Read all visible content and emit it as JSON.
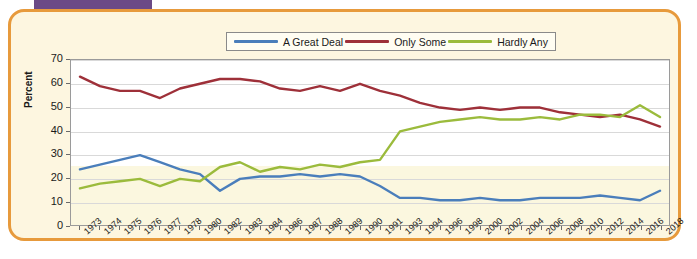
{
  "frame": {
    "accent_border_color": "#e79a3c",
    "card_background": "#fdf6e0",
    "topbar_color": "#6b4a86"
  },
  "chart_data": {
    "type": "line",
    "title": "",
    "subtitle": "",
    "xlabel": "",
    "ylabel": "Percent",
    "ylim": [
      0,
      70
    ],
    "ytick_values": [
      0,
      10,
      20,
      30,
      40,
      50,
      60,
      70
    ],
    "grid": true,
    "legend_position": "top-center",
    "categories": [
      "1973",
      "1974",
      "1975",
      "1976",
      "1977",
      "1978",
      "1980",
      "1982",
      "1983",
      "1984",
      "1986",
      "1987",
      "1988",
      "1989",
      "1990",
      "1991",
      "1993",
      "1994",
      "1996",
      "1998",
      "2000",
      "2002",
      "2004",
      "2006",
      "2008",
      "2010",
      "2012",
      "2014",
      "2016",
      "2018"
    ],
    "series": [
      {
        "name": "A Great Deal",
        "color": "#4a7ebb",
        "values": [
          24,
          26,
          28,
          30,
          27,
          24,
          22,
          15,
          20,
          21,
          21,
          22,
          21,
          22,
          21,
          17,
          12,
          12,
          11,
          11,
          12,
          11,
          11,
          12,
          12,
          12,
          13,
          12,
          11,
          15
        ]
      },
      {
        "name": "Only Some",
        "color": "#9e3039",
        "values": [
          63,
          59,
          57,
          57,
          54,
          58,
          60,
          62,
          62,
          61,
          58,
          57,
          59,
          57,
          60,
          57,
          55,
          52,
          50,
          49,
          50,
          49,
          50,
          50,
          48,
          47,
          46,
          47,
          45,
          42
        ]
      },
      {
        "name": "Hardly Any",
        "color": "#9bbb3c",
        "values": [
          16,
          18,
          19,
          20,
          17,
          20,
          19,
          25,
          27,
          23,
          25,
          24,
          26,
          25,
          27,
          28,
          40,
          42,
          44,
          45,
          46,
          45,
          45,
          46,
          45,
          47,
          47,
          46,
          51,
          46
        ]
      }
    ]
  },
  "legend": {
    "items": [
      {
        "label": "A Great Deal",
        "color": "#4a7ebb"
      },
      {
        "label": "Only Some",
        "color": "#9e3039"
      },
      {
        "label": "Hardly Any",
        "color": "#9bbb3c"
      }
    ]
  }
}
